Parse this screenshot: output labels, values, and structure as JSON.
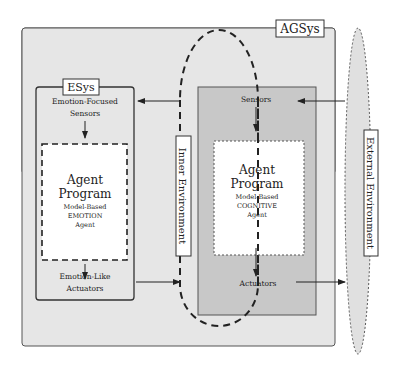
{
  "agsys": {
    "label": "AGSys"
  },
  "esys": {
    "label": "ESys",
    "sensors": [
      "Emotion-Focused",
      "Sensors"
    ],
    "program_title": [
      "Agent",
      "Program"
    ],
    "program_sub": [
      "Model-Based",
      "EMOTION",
      "Agent"
    ],
    "actuators": [
      "Emotion-Like",
      "Actuators"
    ]
  },
  "cognitive": {
    "sensors": "Sensors",
    "program_title": [
      "Agent",
      "Program"
    ],
    "program_sub": [
      "Model-Based",
      "COGNITIVE",
      "Agent"
    ],
    "actuators": "Actuators"
  },
  "inner_environment": {
    "label": "Inner Environment"
  },
  "external_environment": {
    "label": "External Environment"
  },
  "colors": {
    "agsys_fill": "#e6e6e6",
    "cognitive_fill": "#c8c8c8",
    "external_fill": "#e0e0e0",
    "stroke": "#333333"
  }
}
